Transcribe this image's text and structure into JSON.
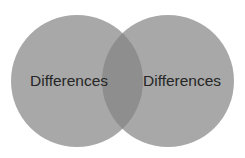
{
  "diagram": {
    "type": "venn",
    "left_circle": {
      "label": "Differences",
      "color": "#a6a6a6"
    },
    "right_circle": {
      "label": "Differences",
      "color": "#a6a6a6"
    },
    "overlap_color": "#8f8f8f"
  }
}
